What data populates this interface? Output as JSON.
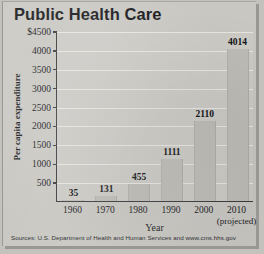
{
  "chart_data": {
    "type": "bar",
    "title": "Public Health Care",
    "xlabel": "Year",
    "ylabel": "Per capita expenditure",
    "categories": [
      "1960",
      "1970",
      "1980",
      "1990",
      "2000",
      "2010"
    ],
    "category_sublabels": [
      "",
      "",
      "",
      "",
      "",
      "(projected)"
    ],
    "values": [
      35,
      131,
      455,
      1111,
      2110,
      4014
    ],
    "value_labels": [
      "35",
      "131",
      "455",
      "1111",
      "2110",
      "4014"
    ],
    "ylim": [
      0,
      4500
    ],
    "ytick_values": [
      500,
      1000,
      1500,
      2000,
      2500,
      3000,
      3500,
      4000,
      4500
    ],
    "ytick_labels": [
      "500",
      "1000",
      "1500",
      "2000",
      "2500",
      "3000",
      "3500",
      "4000",
      "$4500"
    ],
    "grid": true,
    "legend": "none",
    "source_note": "Sources: U.S. Department of Health and Human Services and www.cms.hhs.gov",
    "colors": {
      "bar_fill": "#bdbcb6",
      "background": "#c8c7c2",
      "plot_background": "#cbcac5",
      "axis": "#3b3b3d",
      "gridline": "#eceae4",
      "text": "#1a1a1c"
    }
  }
}
